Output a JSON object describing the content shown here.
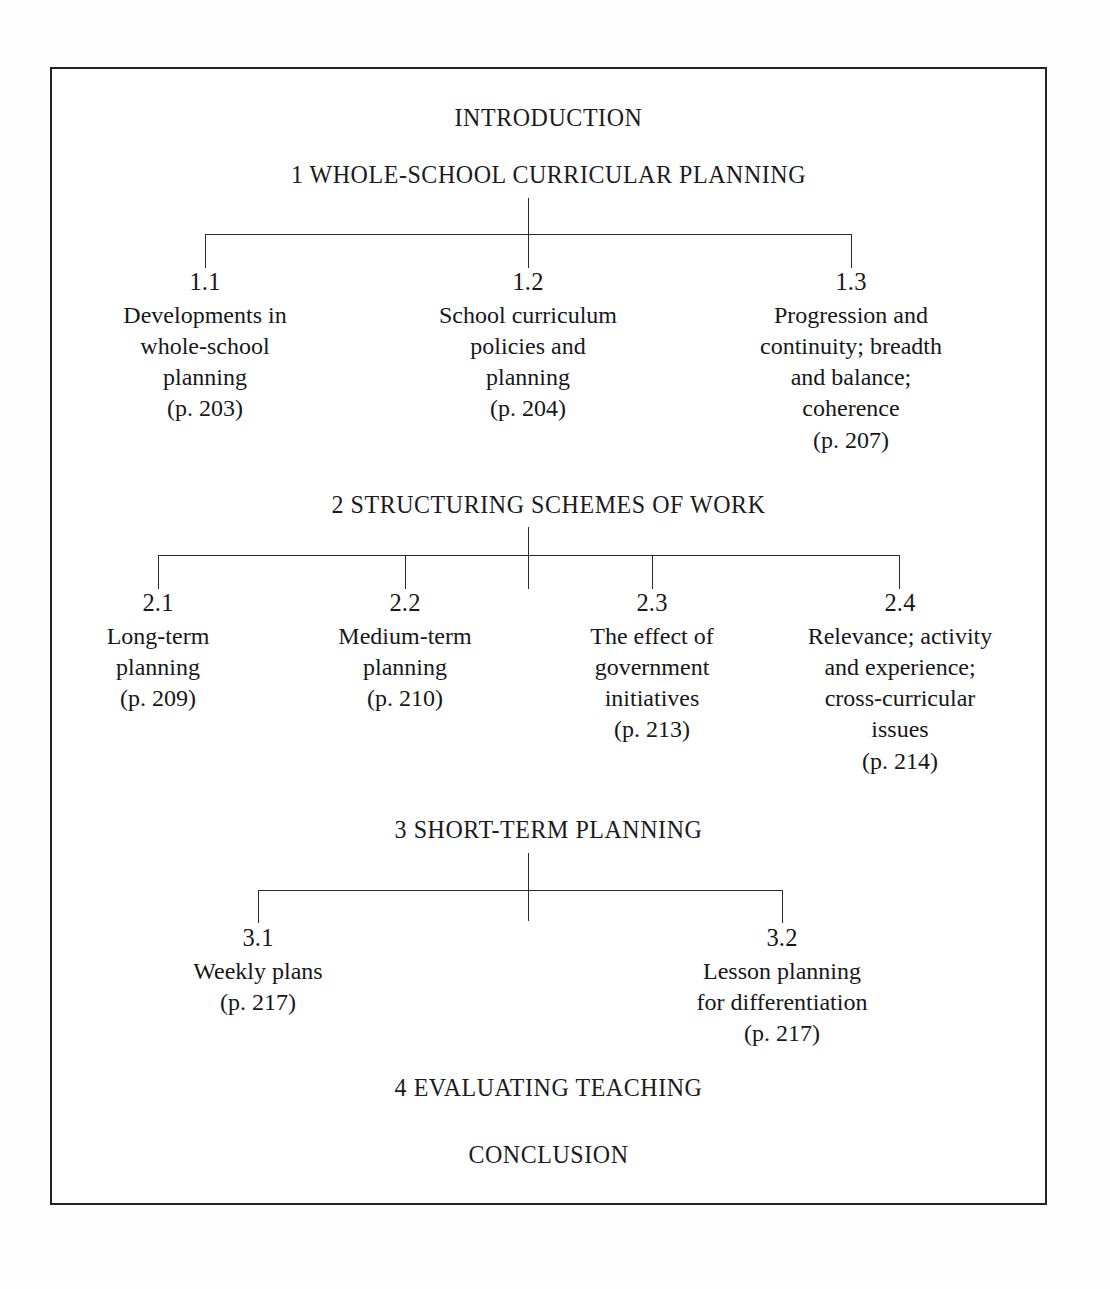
{
  "document": {
    "type": "chapter-outline-flowchart",
    "border_color": "#222226",
    "text_color": "#17171a",
    "background": "#ffffff"
  },
  "headings": {
    "introduction": "INTRODUCTION",
    "section1": "1 WHOLE-SCHOOL CURRICULAR PLANNING",
    "section2": "2 STRUCTURING SCHEMES OF WORK",
    "section3": "3 SHORT-TERM PLANNING",
    "section4": "4 EVALUATING TEACHING",
    "conclusion": "CONCLUSION"
  },
  "section1_nodes": [
    {
      "number": "1.1",
      "lines": [
        "Developments in",
        "whole-school",
        "planning"
      ],
      "page": "(p. 203)",
      "line1": "Developments in",
      "line2": "whole-school",
      "line3": "planning",
      "line4": ""
    },
    {
      "number": "1.2",
      "lines": [
        "School curriculum",
        "policies and",
        "planning"
      ],
      "page": "(p. 204)",
      "line1": "School curriculum",
      "line2": "policies and",
      "line3": "planning",
      "line4": ""
    },
    {
      "number": "1.3",
      "lines": [
        "Progression and",
        "continuity; breadth",
        "and balance;",
        "coherence"
      ],
      "page": "(p. 207)",
      "line1": "Progression and",
      "line2": "continuity; breadth",
      "line3": "and balance;",
      "line4": "coherence"
    }
  ],
  "section2_nodes": [
    {
      "number": "2.1",
      "lines": [
        "Long-term",
        "planning"
      ],
      "page": "(p. 209)",
      "line1": "Long-term",
      "line2": "planning",
      "line3": "",
      "line4": ""
    },
    {
      "number": "2.2",
      "lines": [
        "Medium-term",
        "planning"
      ],
      "page": "(p. 210)",
      "line1": "Medium-term",
      "line2": "planning",
      "line3": "",
      "line4": ""
    },
    {
      "number": "2.3",
      "lines": [
        "The effect of",
        "government",
        "initiatives"
      ],
      "page": "(p. 213)",
      "line1": "The effect of",
      "line2": "government",
      "line3": "initiatives",
      "line4": ""
    },
    {
      "number": "2.4",
      "lines": [
        "Relevance; activity",
        "and experience;",
        "cross-curricular",
        "issues"
      ],
      "page": "(p. 214)",
      "line1": "Relevance; activity",
      "line2": "and experience;",
      "line3": "cross-curricular",
      "line4": "issues"
    }
  ],
  "section3_nodes": [
    {
      "number": "3.1",
      "lines": [
        "Weekly plans"
      ],
      "page": "(p. 217)",
      "line1": "Weekly plans",
      "line2": "",
      "line3": "",
      "line4": ""
    },
    {
      "number": "3.2",
      "lines": [
        "Lesson planning",
        "for differentiation"
      ],
      "page": "(p. 217)",
      "line1": "Lesson planning",
      "line2": "for differentiation",
      "line3": "",
      "line4": ""
    }
  ]
}
